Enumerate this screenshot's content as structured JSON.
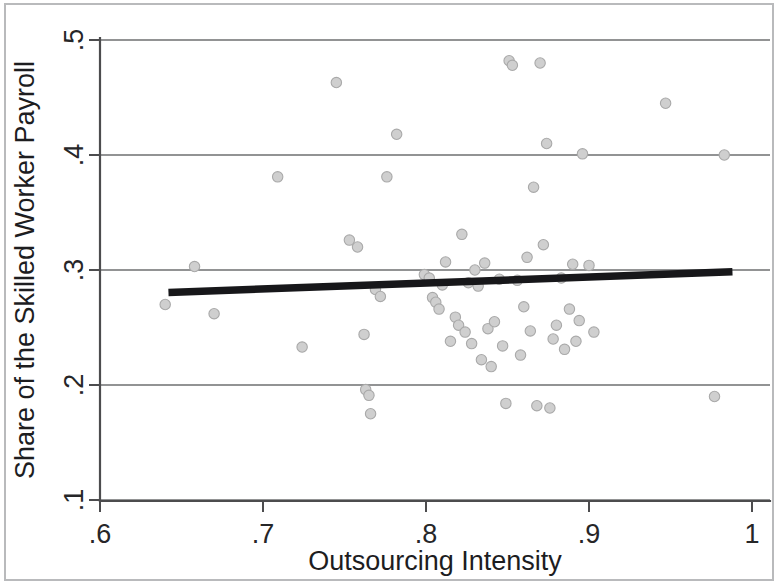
{
  "figure": {
    "title_visible": false,
    "background_color": "#ffffff",
    "frame_color": "#b9babc"
  },
  "axes": {
    "x": {
      "label": "Outsourcing Intensity",
      "ticks": [
        ".6",
        ".7",
        ".8",
        ".9",
        "1"
      ],
      "tick_values": [
        0.6,
        0.7,
        0.8,
        0.9,
        1.0
      ],
      "range": [
        0.6,
        1.0
      ]
    },
    "y": {
      "label": "Share of the Skilled Worker Payroll",
      "ticks": [
        ".1",
        ".2",
        ".3",
        ".4",
        ".5"
      ],
      "tick_values": [
        0.1,
        0.2,
        0.3,
        0.4,
        0.5
      ],
      "range": [
        0.1,
        0.5
      ]
    }
  },
  "style": {
    "marker_fill": "#cfcfcf",
    "marker_stroke": "#a9a9a9",
    "marker_radius": 5.2,
    "fit_line_color": "#17171a",
    "grid_color": "#6e6f71",
    "axis_color": "#4c4c4e"
  },
  "chart_data": {
    "type": "scatter",
    "title": "",
    "subtitle": "",
    "xlabel": "Outsourcing Intensity",
    "ylabel": "Share of the Skilled Worker Payroll",
    "xlim": [
      0.6,
      1.0
    ],
    "ylim": [
      0.1,
      0.5
    ],
    "xticks": [
      0.6,
      0.7,
      0.8,
      0.9,
      1.0
    ],
    "yticks": [
      0.1,
      0.2,
      0.3,
      0.4,
      0.5
    ],
    "xticklabels": [
      ".6",
      ".7",
      ".8",
      ".9",
      "1"
    ],
    "yticklabels": [
      ".1",
      ".2",
      ".3",
      ".4",
      ".5"
    ],
    "grid": "horizontal",
    "legend": "none",
    "annotations": [],
    "series": [
      {
        "name": "observations",
        "type": "scatter",
        "marker": "circle",
        "color": "#cfcfcf",
        "points": [
          [
            0.64,
            0.27
          ],
          [
            0.658,
            0.303
          ],
          [
            0.67,
            0.262
          ],
          [
            0.709,
            0.381
          ],
          [
            0.724,
            0.233
          ],
          [
            0.745,
            0.463
          ],
          [
            0.753,
            0.326
          ],
          [
            0.758,
            0.32
          ],
          [
            0.762,
            0.244
          ],
          [
            0.763,
            0.196
          ],
          [
            0.765,
            0.191
          ],
          [
            0.766,
            0.175
          ],
          [
            0.769,
            0.283
          ],
          [
            0.772,
            0.277
          ],
          [
            0.776,
            0.381
          ],
          [
            0.782,
            0.418
          ],
          [
            0.799,
            0.296
          ],
          [
            0.802,
            0.293
          ],
          [
            0.804,
            0.276
          ],
          [
            0.806,
            0.272
          ],
          [
            0.808,
            0.266
          ],
          [
            0.81,
            0.287
          ],
          [
            0.812,
            0.307
          ],
          [
            0.815,
            0.238
          ],
          [
            0.818,
            0.259
          ],
          [
            0.82,
            0.252
          ],
          [
            0.822,
            0.331
          ],
          [
            0.824,
            0.246
          ],
          [
            0.826,
            0.289
          ],
          [
            0.828,
            0.236
          ],
          [
            0.83,
            0.3
          ],
          [
            0.832,
            0.286
          ],
          [
            0.834,
            0.222
          ],
          [
            0.836,
            0.306
          ],
          [
            0.838,
            0.249
          ],
          [
            0.84,
            0.216
          ],
          [
            0.842,
            0.255
          ],
          [
            0.845,
            0.292
          ],
          [
            0.847,
            0.234
          ],
          [
            0.849,
            0.184
          ],
          [
            0.851,
            0.482
          ],
          [
            0.853,
            0.478
          ],
          [
            0.856,
            0.291
          ],
          [
            0.858,
            0.226
          ],
          [
            0.86,
            0.268
          ],
          [
            0.862,
            0.311
          ],
          [
            0.864,
            0.247
          ],
          [
            0.866,
            0.372
          ],
          [
            0.868,
            0.182
          ],
          [
            0.87,
            0.48
          ],
          [
            0.872,
            0.322
          ],
          [
            0.874,
            0.41
          ],
          [
            0.876,
            0.18
          ],
          [
            0.878,
            0.24
          ],
          [
            0.88,
            0.252
          ],
          [
            0.883,
            0.293
          ],
          [
            0.885,
            0.231
          ],
          [
            0.888,
            0.266
          ],
          [
            0.89,
            0.305
          ],
          [
            0.892,
            0.238
          ],
          [
            0.894,
            0.256
          ],
          [
            0.896,
            0.401
          ],
          [
            0.9,
            0.304
          ],
          [
            0.903,
            0.246
          ],
          [
            0.947,
            0.445
          ],
          [
            0.977,
            0.19
          ],
          [
            0.983,
            0.4
          ]
        ]
      },
      {
        "name": "fitted-line",
        "type": "line",
        "color": "#17171a",
        "endpoints": [
          [
            0.642,
            0.2805
          ],
          [
            0.988,
            0.2985
          ]
        ]
      }
    ]
  }
}
